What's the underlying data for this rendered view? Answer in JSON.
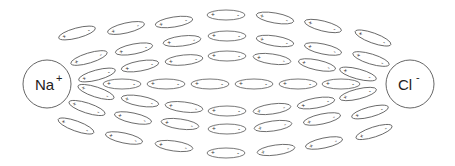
{
  "diagram": {
    "colors": {
      "stroke": "#555555",
      "text": "#222222",
      "background": "#ffffff"
    },
    "ions": [
      {
        "name": "sodium-ion",
        "symbol": "Na",
        "charge": "+",
        "cx": 47,
        "cy": 84,
        "r": 24
      },
      {
        "name": "chloride-ion",
        "symbol": "Cl",
        "charge": "-",
        "cx": 410,
        "cy": 84,
        "r": 24
      }
    ],
    "dipole": {
      "rx": 19,
      "ry": 5,
      "plus": "+",
      "minus": "-"
    },
    "dipoles": [
      {
        "x": 77,
        "y": 33,
        "a": -15
      },
      {
        "x": 126,
        "y": 28,
        "a": -13
      },
      {
        "x": 174,
        "y": 22,
        "a": -9
      },
      {
        "x": 226,
        "y": 15,
        "a": 0
      },
      {
        "x": 275,
        "y": 18,
        "a": 10
      },
      {
        "x": 323,
        "y": 26,
        "a": 14
      },
      {
        "x": 373,
        "y": 38,
        "a": 20
      },
      {
        "x": 89,
        "y": 58,
        "a": -17
      },
      {
        "x": 134,
        "y": 49,
        "a": -11
      },
      {
        "x": 182,
        "y": 41,
        "a": -7
      },
      {
        "x": 227,
        "y": 36,
        "a": 0
      },
      {
        "x": 275,
        "y": 41,
        "a": 9
      },
      {
        "x": 323,
        "y": 49,
        "a": 12
      },
      {
        "x": 371,
        "y": 59,
        "a": 17
      },
      {
        "x": 97,
        "y": 75,
        "a": -15
      },
      {
        "x": 140,
        "y": 66,
        "a": -10
      },
      {
        "x": 184,
        "y": 60,
        "a": -6
      },
      {
        "x": 227,
        "y": 56,
        "a": 0
      },
      {
        "x": 272,
        "y": 59,
        "a": 8
      },
      {
        "x": 317,
        "y": 65,
        "a": 12
      },
      {
        "x": 358,
        "y": 74,
        "a": 15
      },
      {
        "x": 122,
        "y": 84,
        "a": 0
      },
      {
        "x": 166,
        "y": 84,
        "a": 0
      },
      {
        "x": 210,
        "y": 84,
        "a": 0
      },
      {
        "x": 254,
        "y": 84,
        "a": 0
      },
      {
        "x": 298,
        "y": 84,
        "a": 0
      },
      {
        "x": 341,
        "y": 84,
        "a": 0
      },
      {
        "x": 96,
        "y": 92,
        "a": 18
      },
      {
        "x": 140,
        "y": 101,
        "a": 10
      },
      {
        "x": 184,
        "y": 107,
        "a": 7
      },
      {
        "x": 227,
        "y": 111,
        "a": 0
      },
      {
        "x": 272,
        "y": 109,
        "a": -8
      },
      {
        "x": 316,
        "y": 103,
        "a": -10
      },
      {
        "x": 358,
        "y": 94,
        "a": -14
      },
      {
        "x": 87,
        "y": 108,
        "a": 18
      },
      {
        "x": 133,
        "y": 118,
        "a": 12
      },
      {
        "x": 180,
        "y": 124,
        "a": 8
      },
      {
        "x": 227,
        "y": 129,
        "a": 0
      },
      {
        "x": 273,
        "y": 126,
        "a": -8
      },
      {
        "x": 322,
        "y": 119,
        "a": -12
      },
      {
        "x": 370,
        "y": 112,
        "a": -15
      },
      {
        "x": 76,
        "y": 126,
        "a": 20
      },
      {
        "x": 124,
        "y": 138,
        "a": 12
      },
      {
        "x": 174,
        "y": 146,
        "a": 8
      },
      {
        "x": 226,
        "y": 153,
        "a": 0
      },
      {
        "x": 276,
        "y": 150,
        "a": -8
      },
      {
        "x": 324,
        "y": 143,
        "a": -12
      },
      {
        "x": 374,
        "y": 132,
        "a": -18
      }
    ]
  }
}
